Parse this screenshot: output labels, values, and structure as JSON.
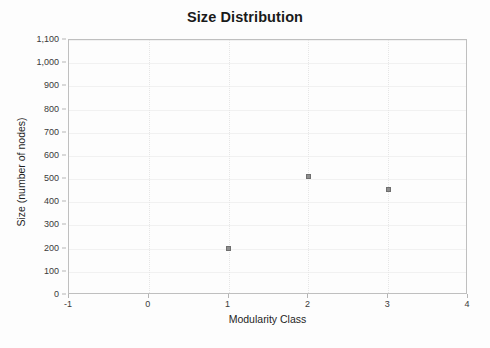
{
  "chart_data": {
    "type": "scatter",
    "title": "Size Distribution",
    "xlabel": "Modularity Class",
    "ylabel": "Size (number of nodes)",
    "xlim": [
      -1,
      4
    ],
    "ylim": [
      0,
      1100
    ],
    "grid": true,
    "legend": null,
    "x": [
      0,
      1,
      2,
      3
    ],
    "values": [
      1145,
      200,
      513,
      455
    ],
    "points": [
      {
        "x": 0,
        "y": 1145
      },
      {
        "x": 1,
        "y": 200
      },
      {
        "x": 2,
        "y": 513
      },
      {
        "x": 3,
        "y": 455
      }
    ],
    "xticks": [
      "-1",
      "0",
      "1",
      "2",
      "3",
      "4"
    ],
    "xtick_values": [
      -1,
      0,
      1,
      2,
      3,
      4
    ],
    "yticks": [
      "0",
      "100",
      "200",
      "300",
      "400",
      "500",
      "600",
      "700",
      "800",
      "900",
      "1,000",
      "1,100"
    ],
    "ytick_values": [
      0,
      100,
      200,
      300,
      400,
      500,
      600,
      700,
      800,
      900,
      1000,
      1100
    ]
  },
  "style": {
    "background": "#fdfdfd",
    "frame_color": "#bfbfbf",
    "point_color": "#8e8e8e",
    "gridline_color": "#f1f1f1",
    "text_color": "#2b2b2b"
  }
}
